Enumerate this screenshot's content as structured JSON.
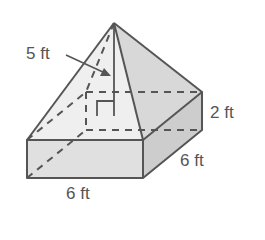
{
  "figure": {
    "type": "composite solid: square pyramid on rectangular prism",
    "labels": {
      "slant_height": "5 ft",
      "prism_height": "2 ft",
      "depth": "6 ft",
      "width": "6 ft"
    },
    "colors": {
      "stroke": "#555555",
      "face_front": "#e2e2e2",
      "face_side": "#cfcfcf",
      "face_pyr_left": "#efefef",
      "face_pyr_right": "#d9d9d9",
      "text": "#555555"
    }
  }
}
